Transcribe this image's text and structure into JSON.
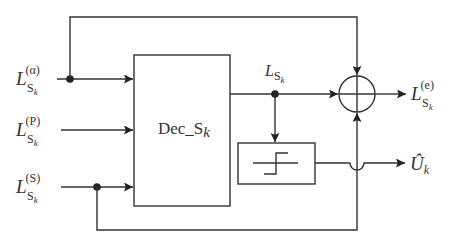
{
  "diagram": {
    "inputs": [
      {
        "id": "alpha",
        "main": "L",
        "sub": "S",
        "subsub": "k",
        "sup": "(α)"
      },
      {
        "id": "p",
        "main": "L",
        "sub": "S",
        "subsub": "k",
        "sup": "(P)"
      },
      {
        "id": "s",
        "main": "L",
        "sub": "S",
        "subsub": "k",
        "sup": "(S)"
      }
    ],
    "decoder_block": {
      "label_main": "Dec_S",
      "label_sub": "k"
    },
    "internal_signal": {
      "main": "L",
      "sub": "S",
      "subsub": "k"
    },
    "threshold_block": {
      "symbol": "hard-decision step"
    },
    "summer": {
      "symbol": "sum-junction"
    },
    "outputs": [
      {
        "id": "extrinsic",
        "main": "L",
        "sub": "S",
        "subsub": "k",
        "sup": "(e)"
      },
      {
        "id": "decision",
        "main": "Û",
        "sub": "k"
      }
    ],
    "colors": {
      "line": "#333333",
      "background": "#ffffff"
    }
  }
}
